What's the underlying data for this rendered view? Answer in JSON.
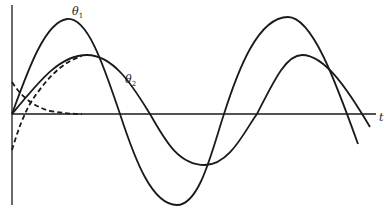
{
  "figure": {
    "type": "time-response-diagram",
    "axes": {
      "horizontal_label": "t",
      "vertical_label": ""
    },
    "curves": [
      {
        "name": "θ1",
        "label_base": "θ",
        "label_sub": "1",
        "style": "solid",
        "description": "larger-amplitude oscillation"
      },
      {
        "name": "θ2",
        "label_base": "θ",
        "label_sub": "2",
        "style": "solid",
        "description": "smaller-amplitude oscillation"
      },
      {
        "name": "transient-decay",
        "style": "dashed",
        "description": "decaying transient component from positive initial value"
      },
      {
        "name": "transient-rise",
        "style": "dashed",
        "description": "transient from negative initial value converging to θ2"
      }
    ],
    "colors": {
      "line": "#1a1a1a",
      "background": "#ffffff"
    }
  }
}
